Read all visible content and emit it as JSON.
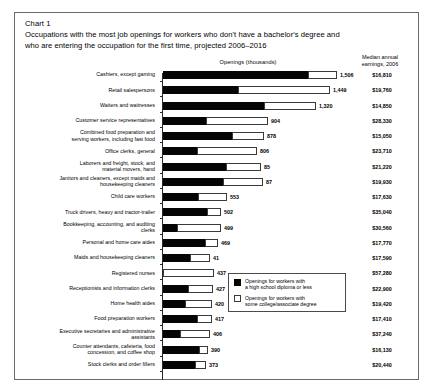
{
  "header": {
    "chart_label": "Chart 1",
    "subtitle_line1": "Occupations with the most job openings for workers who don't have a bachelor's degree and",
    "subtitle_line2": "who are entering the occupation for the first time, projected 2006–2016",
    "openings_header": "Openings (thousands)",
    "earnings_header_line1": "Median annual",
    "earnings_header_line2": "earnings, 2006"
  },
  "legend": {
    "items": [
      {
        "swatch": "black",
        "line1": "Openings for workers with",
        "line2": "a high school diploma or less"
      },
      {
        "swatch": "white",
        "line1": "Openings for workers with",
        "line2": "some college/associate degree"
      }
    ]
  },
  "colors": {
    "high_school": "#050505",
    "some_college": "#ffffff",
    "outline": "#3a3a3a",
    "frame": "#6b6b6b"
  },
  "chart_data": {
    "type": "bar",
    "subtype": "stacked-horizontal",
    "title": "Occupations with the most job openings for workers who don't have a bachelor's degree and who are entering the occupation for the first time, projected 2006–2016",
    "xlabel": "Openings (thousands)",
    "ylabel": "",
    "xlim": [
      0,
      1600
    ],
    "grid": false,
    "legend_position": "inside-lower-right",
    "series": [
      {
        "name": "Openings for workers with a high school diploma or less",
        "values": [
          1256,
          652,
          870,
          371,
          598,
          290,
          548,
          520,
          304,
          380,
          120,
          360,
          236,
          0,
          214,
          190,
          290,
          150,
          310,
          280
        ]
      },
      {
        "name": "Openings for workers with some college/associate degree",
        "values": [
          250,
          797,
          450,
          533,
          280,
          516,
          304,
          347,
          249,
          122,
          379,
          109,
          175,
          437,
          213,
          230,
          127,
          256,
          80,
          93
        ]
      }
    ],
    "categories": [
      "Cashiers, except gaming",
      "Retail salespersons",
      "Waiters and waitresses",
      "Customer service representatives",
      "Combined food preparation and serving workers, including fast food",
      "Office clerks, general",
      "Laborers and freight, stock, and material movers, hand",
      "Janitors and cleaners, except maids and housekeeping cleaners",
      "Child care workers",
      "Truck drivers, heavy and tractor-trailer",
      "Bookkeeping, accounting, and auditing clerks",
      "Personal and home care aides",
      "Maids and housekeeping cleaners",
      "Registered nurses",
      "Receptionists and information clerks",
      "Home health aides",
      "Food preparation workers",
      "Executive secretaries and administrative assistants",
      "Counter attendants, cafeteria, food concession, and coffee shop",
      "Stock clerks and order fillers"
    ],
    "totals": [
      1506,
      1449,
      1320,
      904,
      878,
      806,
      852,
      867,
      553,
      502,
      499,
      469,
      411,
      437,
      427,
      420,
      417,
      406,
      390,
      373
    ],
    "total_labels": [
      "1,506",
      "1,449",
      "1,320",
      "904",
      "878",
      "806",
      "85",
      "87",
      "553",
      "502",
      "499",
      "469",
      "41",
      "437",
      "427",
      "420",
      "417",
      "406",
      "390",
      "373"
    ],
    "earnings": [
      "$16,810",
      "$19,760",
      "$14,850",
      "$28,330",
      "$15,050",
      "$23,710",
      "$21,220",
      "$19,930",
      "$17,630",
      "$35,040",
      "$30,560",
      "$17,770",
      "$17,590",
      "$57,280",
      "$22,900",
      "$19,420",
      "$17,410",
      "$37,240",
      "$16,130",
      "$20,440"
    ]
  },
  "rows": [
    {
      "category_lines": [
        "Cashiers, except gaming"
      ],
      "label": "1,506",
      "earnings": "$16,810",
      "a": 1256,
      "b": 250
    },
    {
      "category_lines": [
        "Retail salespersons"
      ],
      "label": "1,449",
      "earnings": "$19,760",
      "a": 652,
      "b": 797
    },
    {
      "category_lines": [
        "Waiters and waitresses"
      ],
      "label": "1,320",
      "earnings": "$14,850",
      "a": 870,
      "b": 450
    },
    {
      "category_lines": [
        "Customer service representatives"
      ],
      "label": "904",
      "earnings": "$28,330",
      "a": 371,
      "b": 533
    },
    {
      "category_lines": [
        "Combined food preparation and",
        "serving workers, including fast food"
      ],
      "label": "878",
      "earnings": "$15,050",
      "a": 598,
      "b": 280
    },
    {
      "category_lines": [
        "Office clerks, general"
      ],
      "label": "806",
      "earnings": "$23,710",
      "a": 290,
      "b": 516
    },
    {
      "category_lines": [
        "Laborers and freight, stock, and",
        "material movers, hand"
      ],
      "label": "85",
      "earnings": "$21,220",
      "a": 548,
      "b": 304
    },
    {
      "category_lines": [
        "Janitors and cleaners, except maids and",
        "housekeeping cleaners"
      ],
      "label": "87",
      "earnings": "$19,930",
      "a": 520,
      "b": 347
    },
    {
      "category_lines": [
        "Child care workers"
      ],
      "label": "553",
      "earnings": "$17,630",
      "a": 304,
      "b": 249
    },
    {
      "category_lines": [
        "Truck drivers, heavy and tractor-trailer"
      ],
      "label": "502",
      "earnings": "$35,040",
      "a": 380,
      "b": 122
    },
    {
      "category_lines": [
        "Bookkeeping, accounting, and auditing",
        "clerks"
      ],
      "label": "499",
      "earnings": "$30,560",
      "a": 120,
      "b": 379
    },
    {
      "category_lines": [
        "Personal and home care aides"
      ],
      "label": "469",
      "earnings": "$17,770",
      "a": 360,
      "b": 109
    },
    {
      "category_lines": [
        "Maids and housekeeping cleaners"
      ],
      "label": "41",
      "earnings": "$17,590",
      "a": 236,
      "b": 175
    },
    {
      "category_lines": [
        "Registered nurses"
      ],
      "label": "437",
      "earnings": "$57,280",
      "a": 0,
      "b": 437
    },
    {
      "category_lines": [
        "Receptionists and information clerks"
      ],
      "label": "427",
      "earnings": "$22,900",
      "a": 214,
      "b": 213
    },
    {
      "category_lines": [
        "Home health aides"
      ],
      "label": "420",
      "earnings": "$19,420",
      "a": 190,
      "b": 230
    },
    {
      "category_lines": [
        "Food preparation workers"
      ],
      "label": "417",
      "earnings": "$17,410",
      "a": 290,
      "b": 127
    },
    {
      "category_lines": [
        "Executive secretaries and administrative",
        "assistants"
      ],
      "label": "406",
      "earnings": "$37,240",
      "a": 150,
      "b": 256
    },
    {
      "category_lines": [
        "Counter attendants, cafeteria, food",
        "concession, and coffee shop"
      ],
      "label": "390",
      "earnings": "$16,130",
      "a": 310,
      "b": 80
    },
    {
      "category_lines": [
        "Stock clerks and order fillers"
      ],
      "label": "373",
      "earnings": "$20,440",
      "a": 280,
      "b": 93
    }
  ]
}
